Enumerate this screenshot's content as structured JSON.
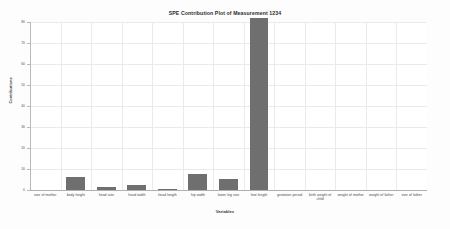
{
  "chart_data": {
    "type": "bar",
    "title": "SPE Contribution Plot of Measurement 1234",
    "xlabel": "Variables",
    "ylabel": "Contributions",
    "grid": true,
    "legend": null,
    "ylim": [
      0,
      80
    ],
    "yticks": [
      0,
      10,
      20,
      30,
      40,
      50,
      60,
      70,
      80
    ],
    "ytick_labels": [
      "0",
      "10",
      "20",
      "30",
      "40",
      "50",
      "60",
      "70",
      "80"
    ],
    "categories": [
      "size of mother",
      "body height",
      "head size",
      "head width",
      "head length",
      "hip width",
      "lower leg size",
      "foot length",
      "gestation period",
      "birth weight of child",
      "weight of mother",
      "weight of father",
      "size of father"
    ],
    "values": [
      0,
      6.2,
      1.2,
      2.4,
      0.4,
      7.6,
      5.2,
      84,
      0,
      0,
      0,
      0,
      0
    ],
    "bar_color": "#6f6f6f"
  }
}
